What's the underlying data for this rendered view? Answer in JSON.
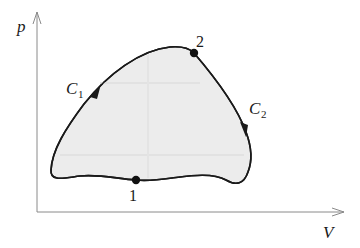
{
  "diagram": {
    "type": "p-V cycle diagram",
    "axes": {
      "y_label": "p",
      "x_label": "V",
      "color": "#8a8a8a"
    },
    "region": {
      "fill": "#ececec",
      "stroke": "#1a1a1a"
    },
    "points": [
      {
        "id": "1",
        "label": "1"
      },
      {
        "id": "2",
        "label": "2"
      }
    ],
    "curves": [
      {
        "id": "C1",
        "label": "C",
        "subscript": "1",
        "direction": "from point 1 up to point 2 (left side)"
      },
      {
        "id": "C2",
        "label": "C",
        "subscript": "2",
        "direction": "from point 2 down to point 1 (right side)"
      }
    ]
  }
}
